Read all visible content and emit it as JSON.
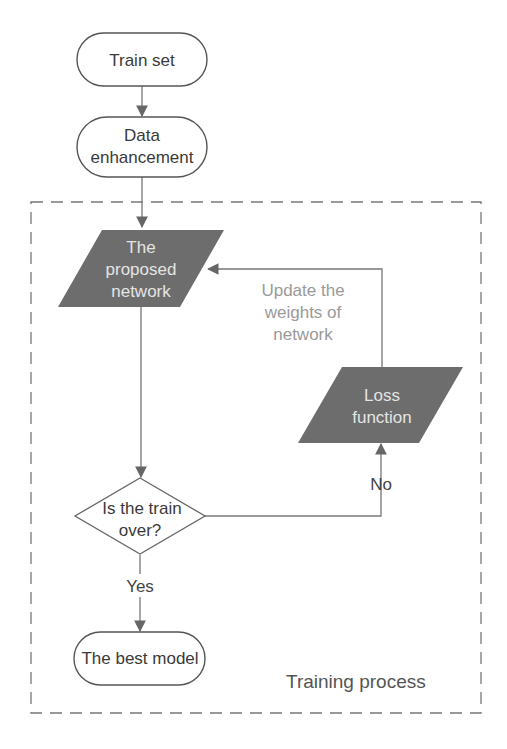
{
  "diagram": {
    "type": "flowchart",
    "nodes": {
      "train_set": {
        "label": "Train set",
        "shape": "terminator"
      },
      "data_enhancement": {
        "label_line1": "Data",
        "label_line2": "enhancement",
        "shape": "terminator"
      },
      "proposed_network": {
        "label_line1": "The",
        "label_line2": "proposed",
        "label_line3": "network",
        "shape": "parallelogram",
        "fill": "#6d6d6d"
      },
      "loss_function": {
        "label_line1": "Loss",
        "label_line2": "function",
        "shape": "parallelogram",
        "fill": "#6d6d6d"
      },
      "decision": {
        "label_line1": "Is the train",
        "label_line2": "over?",
        "shape": "diamond"
      },
      "best_model": {
        "label": "The best model",
        "shape": "terminator"
      }
    },
    "edges": [
      {
        "from": "train_set",
        "to": "data_enhancement",
        "label": ""
      },
      {
        "from": "data_enhancement",
        "to": "proposed_network",
        "label": ""
      },
      {
        "from": "proposed_network",
        "to": "decision",
        "label": ""
      },
      {
        "from": "decision",
        "to": "loss_function",
        "label": "No"
      },
      {
        "from": "loss_function",
        "to": "proposed_network",
        "label": "Update the weights of network"
      },
      {
        "from": "decision",
        "to": "best_model",
        "label": "Yes"
      }
    ],
    "edge_labels": {
      "no": "No",
      "yes": "Yes",
      "update_line1": "Update the",
      "update_line2": "weights of",
      "update_line3": "network"
    },
    "group": {
      "label": "Training process",
      "style": "dashed"
    },
    "colors": {
      "dark_fill": "#6d6d6d",
      "stroke": "#555555",
      "text": "#3a3a3a"
    }
  }
}
